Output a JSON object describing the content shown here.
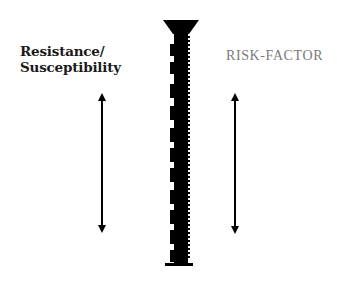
{
  "diagram": {
    "left_label": {
      "line1": "Resistance/",
      "line2": "Susceptibility"
    },
    "right_label": "RISK-FACTOR",
    "center_figure": "screw-icon",
    "arrows": [
      {
        "name": "left-double-arrow",
        "direction": "vertical-bidirectional"
      },
      {
        "name": "right-double-arrow",
        "direction": "vertical-bidirectional"
      }
    ],
    "colors": {
      "ink": "#000000",
      "left_label": "#1a1a1a",
      "right_label": "#7a7a7a",
      "background": "#ffffff"
    }
  }
}
